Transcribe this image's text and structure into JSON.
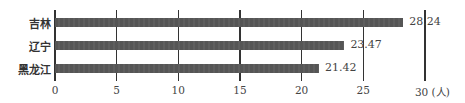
{
  "chart_data": {
    "type": "bar",
    "orientation": "horizontal",
    "title": "",
    "categories": [
      "吉林",
      "辽宁",
      "黑龙江"
    ],
    "values": [
      28.24,
      23.47,
      21.42
    ],
    "value_labels": [
      "28.24",
      "23.47",
      "21.42"
    ],
    "xlabel": "",
    "x_unit": "(人)",
    "ylabel": "",
    "xlim": [
      0,
      30
    ],
    "x_ticks": [
      0,
      5,
      10,
      15,
      20,
      25,
      30
    ],
    "x_tick_labels": [
      "0",
      "5",
      "10",
      "15",
      "20",
      "25",
      "30 (人)"
    ],
    "grid": "vertical lines at each tick",
    "legend": null,
    "bar_color": "#555555"
  }
}
